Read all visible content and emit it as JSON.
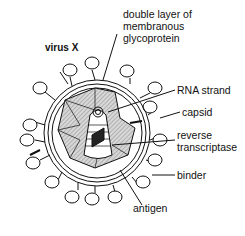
{
  "diagram": {
    "title": "virus X",
    "labels": {
      "membrane_1": "double layer of",
      "membrane_2": "membranous",
      "membrane_3": "glycoprotein",
      "rna": "RNA strand",
      "capsid": "capsid",
      "rt_1": "reverse",
      "rt_2": "transcriptase",
      "binder": "binder",
      "antigen": "antigen"
    },
    "colors": {
      "line": "#111111",
      "fill": "#cfcfcf",
      "background": "#ffffff"
    }
  }
}
